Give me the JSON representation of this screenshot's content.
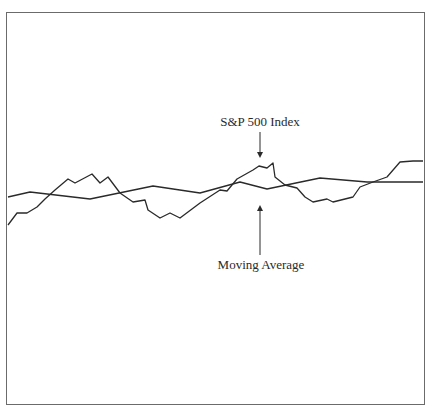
{
  "chart_data": {
    "type": "line",
    "title": "",
    "xlabel": "",
    "ylabel": "",
    "grid": false,
    "legend": "none",
    "annotations": [
      {
        "text": "S&P 500 Index",
        "points_to": "S&P 500 Index",
        "arrow": "down"
      },
      {
        "text": "Moving Average",
        "points_to": "Moving Average",
        "arrow": "up"
      }
    ],
    "series": [
      {
        "name": "S&P 500 Index",
        "points": [
          [
            8,
            225
          ],
          [
            17,
            213
          ],
          [
            27,
            213
          ],
          [
            37,
            207
          ],
          [
            45,
            199
          ],
          [
            55,
            190
          ],
          [
            68,
            179
          ],
          [
            75,
            183
          ],
          [
            92,
            174
          ],
          [
            100,
            183
          ],
          [
            108,
            177
          ],
          [
            120,
            193
          ],
          [
            133,
            202
          ],
          [
            145,
            200
          ],
          [
            148,
            210
          ],
          [
            160,
            218
          ],
          [
            170,
            213
          ],
          [
            180,
            218
          ],
          [
            200,
            203
          ],
          [
            220,
            190
          ],
          [
            227,
            191
          ],
          [
            237,
            179
          ],
          [
            253,
            170
          ],
          [
            259,
            166
          ],
          [
            267,
            168
          ],
          [
            273,
            163
          ],
          [
            275,
            177
          ],
          [
            285,
            185
          ],
          [
            297,
            188
          ],
          [
            305,
            197
          ],
          [
            313,
            202
          ],
          [
            327,
            199
          ],
          [
            333,
            202
          ],
          [
            353,
            197
          ],
          [
            360,
            187
          ],
          [
            373,
            182
          ],
          [
            387,
            177
          ],
          [
            400,
            162
          ],
          [
            413,
            161
          ],
          [
            423,
            161
          ]
        ]
      },
      {
        "name": "Moving Average",
        "points": [
          [
            8,
            197
          ],
          [
            30,
            192
          ],
          [
            90,
            199
          ],
          [
            153,
            186
          ],
          [
            200,
            193
          ],
          [
            240,
            182
          ],
          [
            267,
            189
          ],
          [
            320,
            178
          ],
          [
            367,
            182
          ],
          [
            423,
            182
          ]
        ]
      }
    ],
    "colors": {
      "line": "#2a2a2a",
      "frame": "#6b6b6b",
      "background": "#ffffff"
    }
  },
  "labels": {
    "sp500": "S&P 500 Index",
    "moving_average": "Moving Average"
  }
}
